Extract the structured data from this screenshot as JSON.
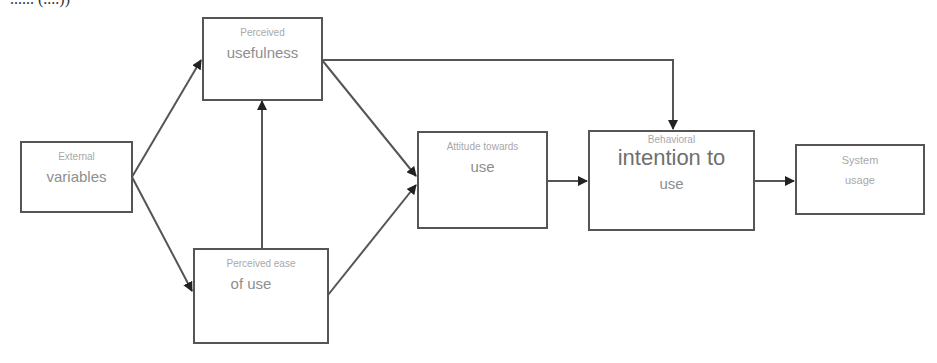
{
  "header": {
    "cut_text": "...... (....))"
  },
  "nodes": {
    "external": {
      "line1": "External",
      "line2": "variables"
    },
    "pu": {
      "line1": "Perceived",
      "line2": "usefulness"
    },
    "peou": {
      "line1": "Perceived ease",
      "line2": "of use"
    },
    "atu": {
      "line1": "Attitude towards",
      "line2": "use"
    },
    "bi": {
      "line1": "Behavioral",
      "line2": "intention to",
      "line3": "use"
    },
    "su": {
      "line1": "System",
      "line2": "usage"
    }
  },
  "edges": [
    {
      "from": "External variables",
      "to": "Perceived usefulness"
    },
    {
      "from": "External variables",
      "to": "Perceived ease of use"
    },
    {
      "from": "Perceived ease of use",
      "to": "Perceived usefulness"
    },
    {
      "from": "Perceived usefulness",
      "to": "Attitude towards use"
    },
    {
      "from": "Perceived ease of use",
      "to": "Attitude towards use"
    },
    {
      "from": "Perceived usefulness",
      "to": "Behavioral intention to use"
    },
    {
      "from": "Attitude towards use",
      "to": "Behavioral intention to use"
    },
    {
      "from": "Behavioral intention to use",
      "to": "System usage"
    }
  ],
  "colors": {
    "line": "#555555",
    "text": "#9a9a9a"
  }
}
